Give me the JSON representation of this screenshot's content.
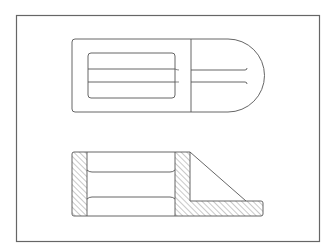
{
  "drawing": {
    "title": "Orthographic technical drawing: top view and sectional front view",
    "colors": {
      "background": "#ffffff",
      "line": "#555555",
      "frame": "#666666",
      "hatch": "#777777"
    },
    "views": [
      {
        "name": "top-view",
        "label": ""
      },
      {
        "name": "section-view",
        "label": ""
      }
    ]
  }
}
